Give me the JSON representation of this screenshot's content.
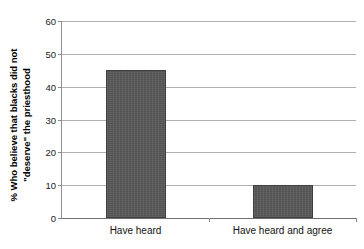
{
  "chart_data": {
    "type": "bar",
    "title": "",
    "subtitle": "",
    "xlabel": "",
    "ylabel_line1": "% Who believe that blacks did not",
    "ylabel_line2": "\"deserve\" the priesthood",
    "categories": [
      "Have heard",
      "Have heard and agree"
    ],
    "values": [
      45,
      10
    ],
    "ylim": [
      0,
      60
    ],
    "ytick_values": [
      0,
      10,
      20,
      30,
      40,
      50,
      60
    ],
    "ytick_labels": [
      "0",
      "10",
      "20",
      "30",
      "40",
      "50",
      "60"
    ],
    "grid": true,
    "legend": "none",
    "bar_color": "#5a5a5a",
    "bar_edge_color": "#3f3f3f",
    "gridline_color": "#b0b0b0",
    "axis_color": "#808080",
    "background_color": "#ffffff",
    "series": [
      {
        "name": "% Who believe that blacks did not \"deserve\" the priesthood",
        "values": [
          45,
          10
        ]
      }
    ]
  }
}
